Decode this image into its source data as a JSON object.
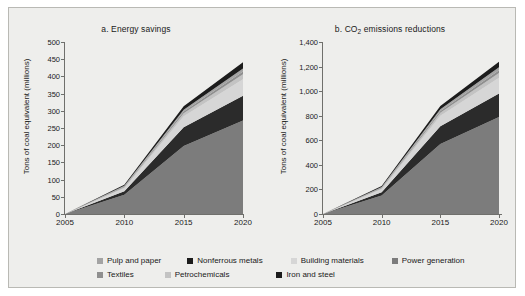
{
  "figure": {
    "background": "#eeeeec",
    "border_color": "#b9b9b4"
  },
  "series_colors": {
    "power_generation": "#7c7c7c",
    "iron_and_steel": "#2b2b2b",
    "building_materials": "#d6d6d6",
    "petrochemicals": "#c3c3c3",
    "textiles": "#8f8f8f",
    "pulp_and_paper": "#a3a3a3",
    "nonferrous_metals": "#1c1c1c"
  },
  "legend": {
    "rows": [
      [
        {
          "label": "Pulp and paper",
          "color": "#a3a3a3"
        },
        {
          "label": "Nonferrous metals",
          "color": "#1c1c1c"
        },
        {
          "label": "Building materials",
          "color": "#d6d6d6"
        },
        {
          "label": "Power generation",
          "color": "#7c7c7c"
        }
      ],
      [
        {
          "label": "Textiles",
          "color": "#8f8f8f"
        },
        {
          "label": "Petrochemicals",
          "color": "#c3c3c3"
        },
        {
          "label": "Iron and steel",
          "color": "#1c1c1c"
        }
      ]
    ]
  },
  "chart_data": [
    {
      "type": "area",
      "id": "a",
      "title_prefix": "a.",
      "title": "a. Energy savings",
      "title_main": "Energy savings",
      "xlabel": "",
      "ylabel": "Tons of coal equivalent (millions)",
      "x": [
        2005,
        2010,
        2015,
        2020
      ],
      "xticklabels": [
        "2005",
        "2010",
        "2015",
        "2020"
      ],
      "xlim": [
        2005,
        2020
      ],
      "ylim": [
        0,
        500
      ],
      "yticks": [
        0,
        50,
        100,
        150,
        200,
        250,
        300,
        350,
        400,
        450,
        500
      ],
      "yticklabels": [
        "0",
        "50",
        "100",
        "150",
        "200",
        "250",
        "300",
        "350",
        "400",
        "450",
        "500"
      ],
      "stack_order_bottom_to_top": [
        "Power generation",
        "Iron and steel",
        "Building materials",
        "Petrochemicals",
        "Textiles",
        "Pulp and paper",
        "Nonferrous metals"
      ],
      "series": [
        {
          "name": "Power generation",
          "color": "#7c7c7c",
          "values": [
            0,
            56,
            198,
            272
          ]
        },
        {
          "name": "Iron and steel",
          "color": "#2b2b2b",
          "values": [
            0,
            10,
            54,
            72
          ]
        },
        {
          "name": "Building materials",
          "color": "#d6d6d6",
          "values": [
            0,
            9,
            32,
            48
          ]
        },
        {
          "name": "Petrochemicals",
          "color": "#c3c3c3",
          "values": [
            0,
            3,
            9,
            14
          ]
        },
        {
          "name": "Textiles",
          "color": "#8f8f8f",
          "values": [
            0,
            2,
            5,
            8
          ]
        },
        {
          "name": "Pulp and paper",
          "color": "#a3a3a3",
          "values": [
            0,
            2,
            5,
            9
          ]
        },
        {
          "name": "Nonferrous metals",
          "color": "#1c1c1c",
          "values": [
            0,
            3,
            10,
            18
          ]
        }
      ],
      "totals": [
        0,
        85,
        313,
        441
      ],
      "grid": false,
      "legend_position": "bottom"
    },
    {
      "type": "area",
      "id": "b",
      "title_prefix": "b.",
      "title": "b. CO2 emissions reductions",
      "title_main": "emissions reductions",
      "title_chem_prefix": "CO",
      "title_chem_sub": "2",
      "xlabel": "",
      "ylabel": "Tons of coal equivalent (millions)",
      "x": [
        2005,
        2010,
        2015,
        2020
      ],
      "xticklabels": [
        "2005",
        "2010",
        "2015",
        "2020"
      ],
      "xlim": [
        2005,
        2020
      ],
      "ylim": [
        0,
        1400
      ],
      "yticks": [
        0,
        200,
        400,
        600,
        800,
        1000,
        1200,
        1400
      ],
      "yticklabels": [
        "0",
        "200",
        "400",
        "600",
        "800",
        "1,000",
        "1,200",
        "1,400"
      ],
      "stack_order_bottom_to_top": [
        "Power generation",
        "Iron and steel",
        "Building materials",
        "Petrochemicals",
        "Textiles",
        "Pulp and paper",
        "Nonferrous metals"
      ],
      "series": [
        {
          "name": "Power generation",
          "color": "#7c7c7c",
          "values": [
            0,
            150,
            570,
            790
          ]
        },
        {
          "name": "Iron and steel",
          "color": "#2b2b2b",
          "values": [
            0,
            28,
            145,
            190
          ]
        },
        {
          "name": "Building materials",
          "color": "#d6d6d6",
          "values": [
            0,
            24,
            85,
            130
          ]
        },
        {
          "name": "Petrochemicals",
          "color": "#c3c3c3",
          "values": [
            0,
            8,
            25,
            38
          ]
        },
        {
          "name": "Textiles",
          "color": "#8f8f8f",
          "values": [
            0,
            5,
            14,
            22
          ]
        },
        {
          "name": "Pulp and paper",
          "color": "#a3a3a3",
          "values": [
            0,
            5,
            14,
            25
          ]
        },
        {
          "name": "Nonferrous metals",
          "color": "#1c1c1c",
          "values": [
            0,
            8,
            27,
            45
          ]
        }
      ],
      "totals": [
        0,
        228,
        880,
        1240
      ],
      "grid": false,
      "legend_position": "bottom"
    }
  ]
}
